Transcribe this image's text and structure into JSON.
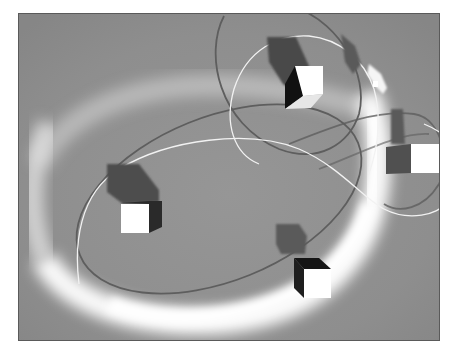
{
  "scene": {
    "caption": "3D scene: floating cubes with shadows, orbit path curves, glowing particle trail ring",
    "background_color": "#8f8f8f",
    "border_color": "#5a5a5a",
    "glow_color": "#ffffff",
    "path_dark_color": "#555555",
    "path_light_color": "#f2f2f2",
    "cubes": [
      {
        "name": "cube-top",
        "face_color": "#ffffff",
        "side_color": "#1a1a1a",
        "shadow_color": "#4a4a4a"
      },
      {
        "name": "cube-left",
        "face_color": "#ffffff",
        "side_color": "#2a2a2a",
        "shadow_color": "#4d4d4d"
      },
      {
        "name": "cube-right",
        "face_color": "#ffffff",
        "side_color": "#505050",
        "shadow_color": "#5a5a5a"
      },
      {
        "name": "cube-bottom",
        "face_color": "#ffffff",
        "side_color": "#151515",
        "shadow_color": "#5a5a5a"
      }
    ],
    "ship": {
      "name": "glowing-ship",
      "color": "#f5f5f5"
    }
  }
}
